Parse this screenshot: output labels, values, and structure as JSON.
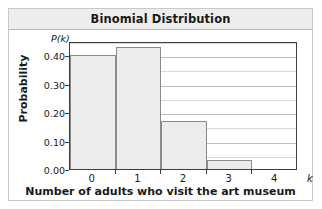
{
  "chart_data": {
    "type": "bar",
    "title": "Binomial Distribution",
    "xlabel": "Number of adults who visit the art museum",
    "ylabel": "Probability",
    "y_axis_symbol": "P(k)",
    "x_axis_symbol": "k",
    "categories": [
      "0",
      "1",
      "2",
      "3",
      "4"
    ],
    "values": [
      0.4,
      0.43,
      0.17,
      0.03,
      0.0
    ],
    "ylim": [
      0.0,
      0.45
    ],
    "xlim": [
      -0.5,
      4.5
    ],
    "ytick_labels": [
      "0.00",
      "0.10",
      "0.20",
      "0.30",
      "0.40"
    ],
    "ytick_values": [
      0.0,
      0.1,
      0.2,
      0.3,
      0.4
    ],
    "gridlines": [
      0.05,
      0.1,
      0.15,
      0.2,
      0.25,
      0.3,
      0.35,
      0.4,
      0.45
    ],
    "grid": true,
    "legend": null,
    "bar_fill_color": "#ececec",
    "bar_border_color": "#8a8a8a",
    "axis_color": "#3d3d3d",
    "gridline_color": "#d8d8d8",
    "title_banner_color": "#ededed",
    "frame_color": "#c9c9c9"
  }
}
